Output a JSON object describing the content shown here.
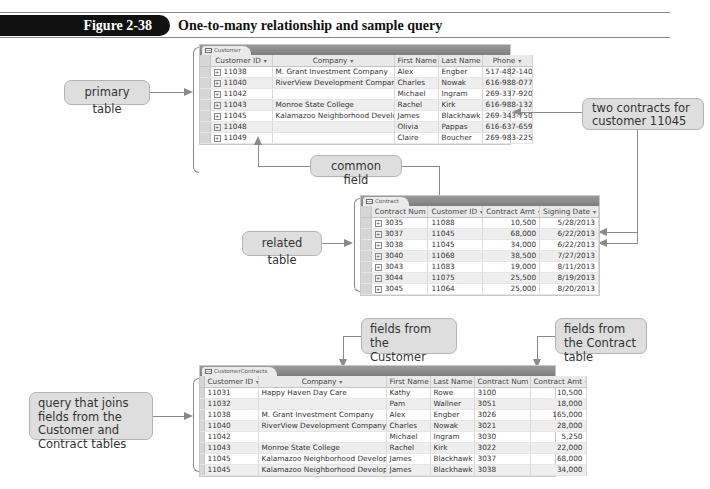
{
  "figure": {
    "label": "Figure 2-38",
    "title": "One-to-many relationship and sample query"
  },
  "callouts": {
    "primary_table": "primary table",
    "two_contracts": "two contracts for customer 11045",
    "common_field": "common field",
    "related_table": "related table",
    "fields_customer": "fields from the Customer table",
    "fields_contract": "fields from the Contract table",
    "query_joins": "query that joins fields from the Customer and Contract tables"
  },
  "customer_table": {
    "tab_label": "Customer",
    "columns": [
      "Customer ID",
      "Company",
      "First Name",
      "Last Name",
      "Phone"
    ],
    "rows": [
      [
        "11038",
        "M. Grant Investment Company",
        "Alex",
        "Engber",
        "517-482-1400"
      ],
      [
        "11040",
        "RiverView Development Company",
        "Charles",
        "Nowak",
        "616-988-0777"
      ],
      [
        "11042",
        "",
        "Michael",
        "Ingram",
        "269-337-9208"
      ],
      [
        "11043",
        "Monroe State College",
        "Rachel",
        "Kirk",
        "616-988-1320"
      ],
      [
        "11045",
        "Kalamazoo Neighborhood Development",
        "James",
        "Blackhawk",
        "269-343-7509"
      ],
      [
        "11048",
        "",
        "Olivia",
        "Pappas",
        "616-637-6591"
      ],
      [
        "11049",
        "",
        "Claire",
        "Boucher",
        "269-983-2255"
      ]
    ]
  },
  "contract_table": {
    "tab_label": "Contract",
    "columns": [
      "Contract Num",
      "Customer ID",
      "Contract Amt",
      "Signing Date"
    ],
    "rows": [
      [
        "3035",
        "11088",
        "10,500",
        "5/28/2013"
      ],
      [
        "3037",
        "11045",
        "68,000",
        "6/22/2013"
      ],
      [
        "3038",
        "11045",
        "34,000",
        "6/22/2013"
      ],
      [
        "3040",
        "11068",
        "38,500",
        "7/27/2013"
      ],
      [
        "3043",
        "11083",
        "19,000",
        "8/11/2013"
      ],
      [
        "3044",
        "11075",
        "25,500",
        "8/19/2013"
      ],
      [
        "3045",
        "11064",
        "25,000",
        "8/20/2013"
      ]
    ]
  },
  "query_table": {
    "tab_label": "CustomerContracts",
    "columns": [
      "Customer ID",
      "Company",
      "First Name",
      "Last Name",
      "Contract Num",
      "Contract Amt"
    ],
    "rows": [
      [
        "11031",
        "Happy Haven Day Care",
        "Kathy",
        "Rowe",
        "3100",
        "10,500"
      ],
      [
        "11032",
        "",
        "Pam",
        "Wallner",
        "3051",
        "18,000"
      ],
      [
        "11038",
        "M. Grant Investment Company",
        "Alex",
        "Engber",
        "3026",
        "165,000"
      ],
      [
        "11040",
        "RiverView Development Company",
        "Charles",
        "Nowak",
        "3021",
        "28,000"
      ],
      [
        "11042",
        "",
        "Michael",
        "Ingram",
        "3030",
        "5,250"
      ],
      [
        "11043",
        "Monroe State College",
        "Rachel",
        "Kirk",
        "3022",
        "22,000"
      ],
      [
        "11045",
        "Kalamazoo Neighborhood Development",
        "James",
        "Blackhawk",
        "3037",
        "68,000"
      ],
      [
        "11045",
        "Kalamazoo Neighborhood Development",
        "James",
        "Blackhawk",
        "3038",
        "34,000"
      ]
    ]
  },
  "icons": {
    "dropdown": "▾",
    "expand": "+"
  }
}
